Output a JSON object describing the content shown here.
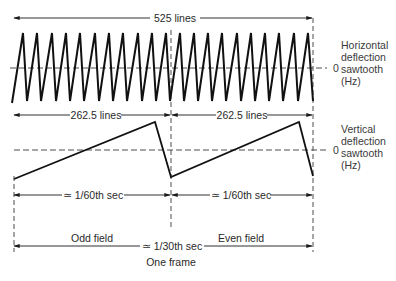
{
  "colors": {
    "line": "#1a1a1a",
    "dashed": "#3a3a3a",
    "text": "#2a2a2a",
    "background": "#ffffff"
  },
  "top_dimension": {
    "label": "525 lines"
  },
  "horizontal_waveform": {
    "label_lines": [
      "Horizontal",
      "deflection",
      "sawtooth",
      "(Hz)"
    ],
    "zero_label": "0",
    "teeth_count": 21
  },
  "line_dimensions": [
    {
      "label": "262.5 lines"
    },
    {
      "label": "262.5 lines"
    }
  ],
  "vertical_waveform": {
    "label_lines": [
      "Vertical",
      "deflection",
      "sawtooth",
      "(Hz)"
    ],
    "zero_label": "0"
  },
  "time_dimensions": [
    {
      "label": "≃ 1/60th sec"
    },
    {
      "label": "≃ 1/60th sec"
    }
  ],
  "field_labels": {
    "odd": "Odd field",
    "even": "Even field",
    "frame_time": "≃ 1/30th sec",
    "frame": "One frame"
  }
}
